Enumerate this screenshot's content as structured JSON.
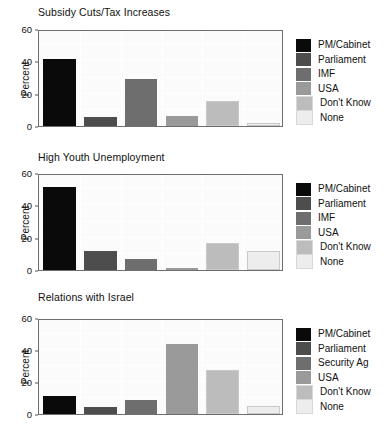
{
  "chart_data": [
    {
      "type": "bar",
      "title": "Subsidy Cuts/Tax Increases",
      "xlabel": "",
      "ylabel": "Percent",
      "ylim": [
        0,
        60
      ],
      "yticks": [
        0,
        20,
        40,
        60
      ],
      "grid": true,
      "legend_position": "right",
      "categories": [
        "PM/Cabinet",
        "Parliament",
        "IMF",
        "USA",
        "Don't Know",
        "None"
      ],
      "values": [
        41.5,
        5.5,
        29,
        6,
        15.5,
        2
      ],
      "colors": [
        "#0a0a0a",
        "#4d4d4d",
        "#6e6e6e",
        "#9a9a9a",
        "#bcbcbc",
        "#ededed"
      ]
    },
    {
      "type": "bar",
      "title": "High Youth Unemployment",
      "xlabel": "",
      "ylabel": "Percent",
      "ylim": [
        0,
        60
      ],
      "yticks": [
        0,
        20,
        40,
        60
      ],
      "grid": true,
      "legend_position": "right",
      "categories": [
        "PM/Cabinet",
        "Parliament",
        "IMF",
        "USA",
        "Don't Know",
        "None"
      ],
      "values": [
        51.5,
        12,
        7,
        1.5,
        17,
        11.5
      ],
      "colors": [
        "#0a0a0a",
        "#4d4d4d",
        "#6e6e6e",
        "#9a9a9a",
        "#bcbcbc",
        "#ededed"
      ]
    },
    {
      "type": "bar",
      "title": "Relations with Israel",
      "xlabel": "",
      "ylabel": "Percent",
      "ylim": [
        0,
        60
      ],
      "yticks": [
        0,
        20,
        40,
        60
      ],
      "grid": true,
      "legend_position": "right",
      "categories": [
        "PM/Cabinet",
        "Parliament",
        "Security Ag",
        "USA",
        "Don't Know",
        "None"
      ],
      "values": [
        11,
        4.5,
        9,
        43.5,
        27.5,
        5
      ],
      "colors": [
        "#0a0a0a",
        "#4d4d4d",
        "#6e6e6e",
        "#9a9a9a",
        "#bcbcbc",
        "#ededed"
      ]
    }
  ]
}
